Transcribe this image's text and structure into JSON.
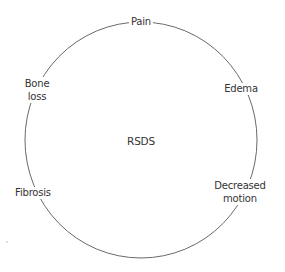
{
  "diagram": {
    "center_label": "RSDS",
    "nodes": [
      {
        "label": "Pain",
        "x": 141,
        "y": 22
      },
      {
        "label": "Edema",
        "x": 241,
        "y": 89
      },
      {
        "label": "Decreased\nmotion",
        "line1": "Decreased",
        "line2": "motion",
        "x": 241,
        "y": 192
      },
      {
        "label": "Fibrosis",
        "x": 32,
        "y": 193
      },
      {
        "label": "Bone\nloss",
        "line1": "Bone",
        "line2": "loss",
        "x": 37,
        "y": 90
      }
    ],
    "colors": {
      "line": "#6a6a6a",
      "text": "#333333",
      "background": "#ffffff"
    }
  }
}
